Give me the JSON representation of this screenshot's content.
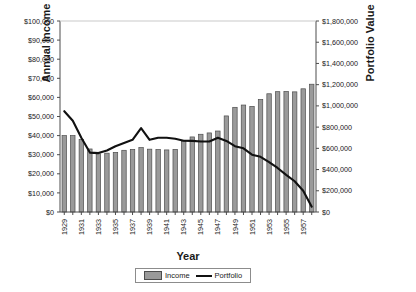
{
  "chart_data": {
    "type": "bar",
    "title": "",
    "xlabel": "Year",
    "ylabel": "Annual Income",
    "ylabel_secondary": "Portfolio Value",
    "grid": false,
    "legend_position": "bottom",
    "categories": [
      1929,
      1930,
      1931,
      1932,
      1933,
      1934,
      1935,
      1936,
      1937,
      1938,
      1939,
      1940,
      1941,
      1942,
      1943,
      1944,
      1945,
      1946,
      1947,
      1948,
      1949,
      1950,
      1951,
      1952,
      1953,
      1954,
      1955,
      1956,
      1957,
      1958
    ],
    "xtick_labels": [
      "1929",
      "1931",
      "1933",
      "1935",
      "1937",
      "1939",
      "1941",
      "1943",
      "1945",
      "1947",
      "1949",
      "1951",
      "1953",
      "1955",
      "1957"
    ],
    "ylim": [
      0,
      100000
    ],
    "ytick_labels": [
      "$0",
      "$10,000",
      "$20,000",
      "$30,000",
      "$40,000",
      "$50,000",
      "$60,000",
      "$70,000",
      "$80,000",
      "$90,000",
      "$100,000"
    ],
    "ytick_values": [
      0,
      10000,
      20000,
      30000,
      40000,
      50000,
      60000,
      70000,
      80000,
      90000,
      100000
    ],
    "ylim_secondary": [
      0,
      1800000
    ],
    "ytick_labels_secondary": [
      "$0",
      "$200,000",
      "$400,000",
      "$600,000",
      "$800,000",
      "$1,000,000",
      "$1,200,000",
      "$1,400,000",
      "$1,600,000",
      "$1,800,000"
    ],
    "ytick_values_secondary": [
      0,
      200000,
      400000,
      600000,
      800000,
      1000000,
      1200000,
      1400000,
      1600000,
      1800000
    ],
    "series": [
      {
        "name": "Income",
        "type": "bar",
        "axis": "left",
        "color": "#9a9a9a",
        "edge_color": "#4d4d4d",
        "values": [
          40000,
          40000,
          38000,
          33000,
          30500,
          30800,
          31200,
          32300,
          32800,
          33700,
          32900,
          32700,
          32500,
          32800,
          36900,
          39300,
          40700,
          41400,
          42400,
          50300,
          54800,
          56000,
          55300,
          58900,
          61900,
          63000,
          63100,
          62900,
          64500,
          66900
        ]
      },
      {
        "name": "Portfolio",
        "type": "line",
        "axis": "right",
        "color": "#111111",
        "values": [
          950000,
          860000,
          700000,
          560000,
          555000,
          580000,
          620000,
          650000,
          680000,
          790000,
          680000,
          700000,
          700000,
          690000,
          672000,
          670000,
          665000,
          665000,
          700000,
          670000,
          620000,
          600000,
          540000,
          520000,
          470000,
          415000,
          350000,
          290000,
          200000,
          50000
        ]
      }
    ]
  },
  "legend": {
    "items": [
      {
        "label": "Income",
        "marker": "bar-swatch"
      },
      {
        "label": "Portfolio",
        "marker": "line-swatch"
      }
    ]
  }
}
